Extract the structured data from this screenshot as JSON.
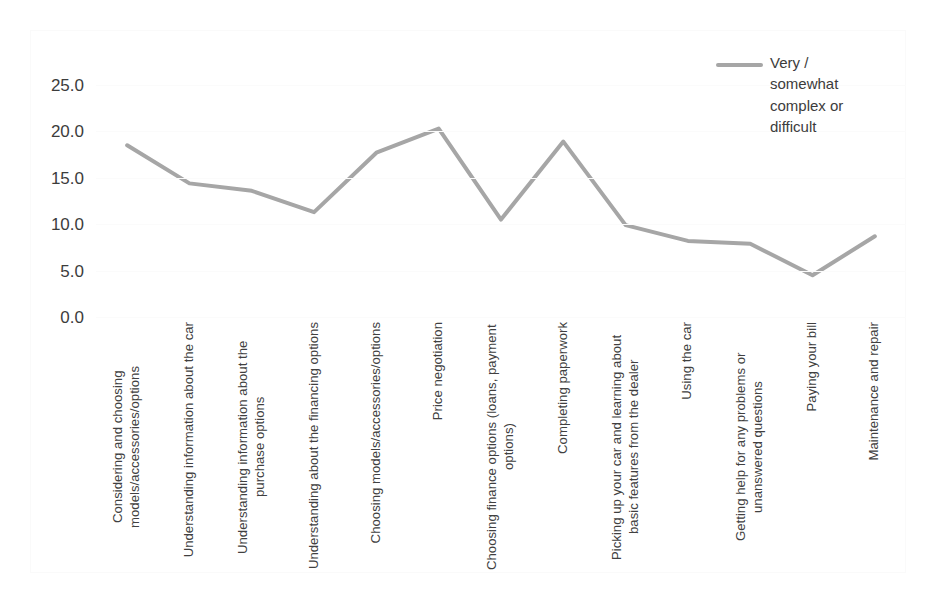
{
  "chart_data": {
    "type": "line",
    "title": "",
    "xlabel": "",
    "ylabel": "",
    "ylim": [
      0.0,
      25.0
    ],
    "ytick_labels": [
      "25.0",
      "20.0",
      "15.0",
      "10.0",
      "5.0",
      "0.0"
    ],
    "ytick_values": [
      25.0,
      20.0,
      15.0,
      10.0,
      5.0,
      0.0
    ],
    "grid": true,
    "legend_position": "top-right",
    "line_color": "#a6a6a6",
    "categories": [
      "Considering and choosing models/accessories/options",
      "Understanding information about the car",
      "Understanding information about the purchase options",
      "Understanding about the financing options",
      "Choosing models/accessories/options",
      "Price negotiation",
      "Choosing finance options (loans, payment options)",
      "Completing paperwork",
      "Picking up your car and learning about basic features from the dealer",
      "Using the car",
      "Getting help for any problems or unanswered questions",
      "Paying your bill",
      "Maintenance and repair"
    ],
    "series": [
      {
        "name": "Very / somewhat complex or difficult",
        "values": [
          18.5,
          14.4,
          13.6,
          11.3,
          17.7,
          20.3,
          10.5,
          18.9,
          9.9,
          8.2,
          7.9,
          4.5,
          8.7
        ]
      }
    ]
  },
  "legend": {
    "entry_label": "Very / somewhat complex or difficult"
  }
}
